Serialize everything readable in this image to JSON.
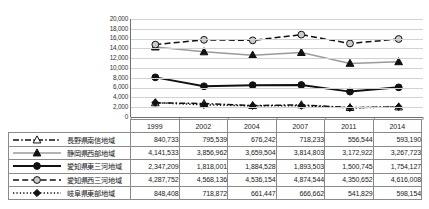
{
  "chart_data": {
    "type": "line",
    "title": "",
    "xlabel": "",
    "ylabel": "",
    "categories": [
      "1999",
      "2002",
      "2004",
      "2007",
      "2011",
      "2014"
    ],
    "ylim": [
      0,
      20000
    ],
    "ytick_labels": [
      "20,000",
      "18,000",
      "16,000",
      "14,000",
      "12,000",
      "10,000",
      "8,000",
      "6,000",
      "4,000",
      "2,000",
      "0"
    ],
    "yticks": [
      20000,
      18000,
      16000,
      14000,
      12000,
      10000,
      8000,
      6000,
      4000,
      2000,
      0
    ],
    "grid": true,
    "legend_position": "table-left",
    "series": [
      {
        "name": "長野県南信地域",
        "marker": "open-triangle",
        "line_style": "dash-dot",
        "line_color": "#111111",
        "marker_fill": "#ffffff",
        "table_values": [
          "840,733",
          "795,539",
          "676,242",
          "718,233",
          "556,544",
          "593,190"
        ],
        "values": [
          2900,
          2750,
          2330,
          2480,
          1920,
          2050
        ]
      },
      {
        "name": "静岡県西部地域",
        "marker": "filled-triangle",
        "line_style": "solid",
        "line_color": "#9a9a9a",
        "marker_fill": "#111111",
        "table_values": [
          "4,141,533",
          "3,856,962",
          "3,659,504",
          "3,814,803",
          "3,172,922",
          "3,267,723"
        ],
        "values": [
          14280,
          13300,
          12620,
          13150,
          10940,
          11270
        ]
      },
      {
        "name": "愛知県東三河地域",
        "marker": "filled-circle",
        "line_style": "solid",
        "line_color": "#111111",
        "marker_fill": "#111111",
        "table_values": [
          "2,347,209",
          "1,818,001",
          "1,884,528",
          "1,893,503",
          "1,500,745",
          "1,754,127"
        ],
        "values": [
          8090,
          6270,
          6500,
          6530,
          5180,
          6050
        ]
      },
      {
        "name": "愛知県西三河地域",
        "marker": "open-circle",
        "line_style": "dashed",
        "line_color": "#111111",
        "marker_fill": "#cccccc",
        "table_values": [
          "4,287,752",
          "4,568,136",
          "4,536,154",
          "4,874,544",
          "4,350,652",
          "4,616,008"
        ],
        "values": [
          14780,
          15750,
          15640,
          16810,
          15000,
          15920
        ]
      },
      {
        "name": "岐阜県東部地域",
        "marker": "filled-diamond",
        "line_style": "dotted",
        "line_color": "#111111",
        "marker_fill": "#111111",
        "table_values": [
          "848,408",
          "718,872",
          "661,447",
          "666,662",
          "541,829",
          "598,154"
        ],
        "values": [
          2925,
          2480,
          2280,
          2300,
          1870,
          2060
        ]
      }
    ]
  },
  "table": {
    "year_header": [
      "1999",
      "2002",
      "2004",
      "2007",
      "2011",
      "2014"
    ]
  }
}
